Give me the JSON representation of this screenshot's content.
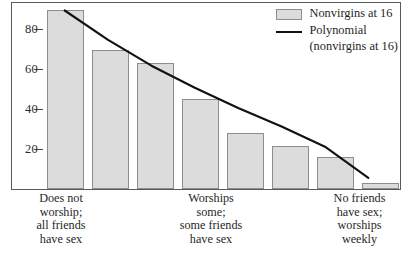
{
  "chart_data": {
    "type": "bar",
    "title": "",
    "xlabel": "",
    "ylabel": "",
    "ylim": [
      0,
      100
    ],
    "yticks": [
      20,
      40,
      60,
      80
    ],
    "grid": false,
    "legend_position": "top-right",
    "categories": [
      "1",
      "2",
      "3",
      "4",
      "5",
      "6",
      "7",
      "8"
    ],
    "category_labels": [
      "Does not\nworship;\nall friends\nhave sex",
      "",
      "",
      "Worships\nsome;\nsome friends\nhave sex",
      "",
      "",
      "",
      "No friends\nhave sex;\nworships\nweekly"
    ],
    "series": [
      {
        "name": "Nonvirgins at 16",
        "type": "bar",
        "values": [
          95,
          74,
          67,
          48,
          30,
          23,
          17,
          3
        ]
      },
      {
        "name": "Polynomial (nonvirgins at 16)",
        "type": "line",
        "values": [
          97,
          81,
          67,
          55,
          44,
          34,
          23,
          6
        ]
      }
    ]
  },
  "axes": {
    "y_tick_labels": [
      "80",
      "60",
      "40",
      "20"
    ]
  },
  "x_axis_labels": [
    {
      "lines": [
        "Does not",
        "worship;",
        "all friends",
        "have sex"
      ]
    },
    {
      "lines": [
        "Worships",
        "some;",
        "some friends",
        "have sex"
      ]
    },
    {
      "lines": [
        "No friends",
        "have sex;",
        "worships",
        "weekly"
      ]
    }
  ],
  "legend": {
    "bar_label": "Nonvirgins at 16",
    "line_label": "Polynomial",
    "line_sublabel": "(nonvirgins at 16)"
  },
  "colors": {
    "bar_fill": "#dcdcdc",
    "bar_stroke": "#8d8d8d",
    "line": "#111111",
    "frame": "#5a5a5a",
    "text": "#1f1f1f"
  }
}
